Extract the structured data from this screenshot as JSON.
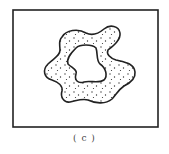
{
  "figure": {
    "caption": "( c )",
    "frame": {
      "x": 13,
      "y": 10,
      "width": 145,
      "height": 117,
      "stroke": "#222222"
    },
    "shape": {
      "type": "irregular-annulus",
      "fill": "stippled",
      "stroke": "#222222",
      "dot_color": "#333333"
    }
  }
}
